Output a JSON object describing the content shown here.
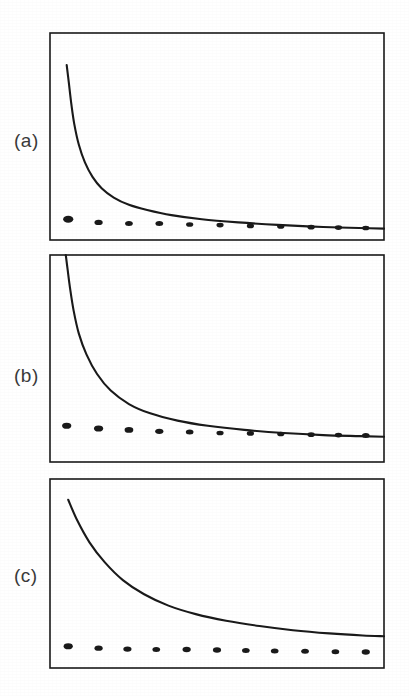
{
  "figure": {
    "background_color": "#ffffff",
    "ink_color": "#1a1a1a",
    "label_color": "#3a3a3a",
    "panels": [
      {
        "id": "a",
        "label": "(a)",
        "frame": {
          "x": 50,
          "y": 33,
          "width": 334,
          "height": 207
        }
      },
      {
        "id": "b",
        "label": "(b)",
        "frame": {
          "x": 50,
          "y": 255,
          "width": 334,
          "height": 207
        }
      },
      {
        "id": "c",
        "label": "(c)",
        "frame": {
          "x": 50,
          "y": 479,
          "width": 334,
          "height": 189
        }
      }
    ]
  },
  "chart_data": [
    {
      "type": "line",
      "panel": "a",
      "title": "(a)",
      "xlabel": "",
      "ylabel": "",
      "grid": false,
      "legend": null,
      "axis_ticks": false,
      "xlim": [
        0,
        11
      ],
      "ylim": [
        0,
        1
      ],
      "series": [
        {
          "name": "decay curve",
          "style": "solid-line",
          "color": "#1a1a1a",
          "x": [
            0.55,
            0.62,
            0.7,
            0.8,
            0.95,
            1.15,
            1.4,
            1.7,
            2.1,
            2.6,
            3.2,
            4.0,
            5.0,
            6.2,
            7.5,
            9.0,
            10.5,
            11.0
          ],
          "y": [
            0.845,
            0.76,
            0.66,
            0.56,
            0.46,
            0.375,
            0.305,
            0.25,
            0.205,
            0.17,
            0.145,
            0.12,
            0.1,
            0.085,
            0.073,
            0.063,
            0.057,
            0.055
          ]
        },
        {
          "name": "data points",
          "style": "filled-ellipse-markers",
          "color": "#1a1a1a",
          "x": [
            0.6,
            1.6,
            2.6,
            3.6,
            4.6,
            5.6,
            6.6,
            7.6,
            8.6,
            9.5,
            10.4
          ],
          "y": [
            0.1,
            0.085,
            0.08,
            0.08,
            0.075,
            0.072,
            0.068,
            0.065,
            0.062,
            0.06,
            0.058
          ],
          "marker_sizes": [
            9,
            7,
            6.5,
            6.5,
            6,
            6,
            6,
            6,
            6,
            6,
            6
          ]
        }
      ]
    },
    {
      "type": "line",
      "panel": "b",
      "title": "(b)",
      "xlabel": "",
      "ylabel": "",
      "grid": false,
      "legend": null,
      "axis_ticks": false,
      "xlim": [
        0,
        11
      ],
      "ylim": [
        0,
        1
      ],
      "series": [
        {
          "name": "decay curve",
          "style": "solid-line",
          "color": "#1a1a1a",
          "x": [
            0.52,
            0.58,
            0.66,
            0.78,
            0.95,
            1.2,
            1.55,
            2.0,
            2.6,
            3.3,
            4.2,
            5.2,
            6.4,
            7.7,
            9.0,
            10.2,
            11.0
          ],
          "y": [
            1.0,
            0.93,
            0.84,
            0.73,
            0.62,
            0.52,
            0.425,
            0.345,
            0.28,
            0.235,
            0.2,
            0.175,
            0.155,
            0.14,
            0.13,
            0.125,
            0.122
          ]
        },
        {
          "name": "data points",
          "style": "filled-ellipse-markers",
          "color": "#1a1a1a",
          "x": [
            0.55,
            1.6,
            2.6,
            3.6,
            4.6,
            5.6,
            6.6,
            7.6,
            8.6,
            9.5,
            10.4
          ],
          "y": [
            0.175,
            0.162,
            0.155,
            0.148,
            0.145,
            0.14,
            0.138,
            0.135,
            0.132,
            0.13,
            0.128
          ],
          "marker_sizes": [
            8,
            8,
            7.5,
            7,
            6.5,
            6,
            6,
            6,
            6,
            6,
            6.5
          ]
        }
      ]
    },
    {
      "type": "line",
      "panel": "c",
      "title": "(c)",
      "xlabel": "",
      "ylabel": "",
      "grid": false,
      "legend": null,
      "axis_ticks": false,
      "xlim": [
        0,
        11
      ],
      "ylim": [
        0,
        1
      ],
      "series": [
        {
          "name": "decay curve",
          "style": "solid-line",
          "color": "#1a1a1a",
          "x": [
            0.6,
            0.9,
            1.3,
            1.8,
            2.4,
            3.1,
            3.9,
            4.8,
            5.8,
            6.9,
            8.0,
            9.2,
            10.3,
            11.0
          ],
          "y": [
            0.89,
            0.78,
            0.665,
            0.56,
            0.465,
            0.39,
            0.33,
            0.285,
            0.25,
            0.222,
            0.2,
            0.183,
            0.172,
            0.168
          ]
        },
        {
          "name": "data points",
          "style": "filled-ellipse-markers",
          "color": "#1a1a1a",
          "x": [
            0.6,
            1.6,
            2.55,
            3.5,
            4.5,
            5.5,
            6.45,
            7.4,
            8.4,
            9.4,
            10.4
          ],
          "y": [
            0.115,
            0.105,
            0.1,
            0.098,
            0.098,
            0.095,
            0.092,
            0.09,
            0.088,
            0.086,
            0.085
          ],
          "marker_sizes": [
            8,
            7,
            7,
            6.5,
            7,
            7,
            6.5,
            6.5,
            6.5,
            6.5,
            7
          ]
        }
      ]
    }
  ]
}
